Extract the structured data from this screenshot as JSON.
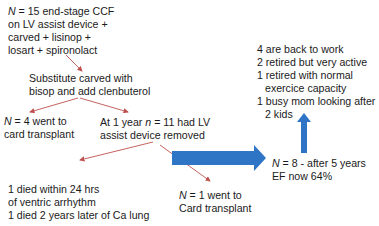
{
  "diagram": {
    "nodes": {
      "start": {
        "lines": [
          "N = 15 end-stage CCF",
          "on LV assist device +",
          "carved + lisinop +",
          "losart + spironolact"
        ]
      },
      "substitute": {
        "lines": [
          "Substitute carved with",
          "bisop and add clenbuterol"
        ]
      },
      "transplant_4": {
        "lines": [
          "N = 4 went to",
          "card transplant"
        ]
      },
      "removed_11": {
        "lines": [
          "At 1 year n = 11 had LV",
          "assist device removed"
        ]
      },
      "died": {
        "lines": [
          "1 died within 24 hrs",
          "of ventric arrhythm",
          "1 died 2 years later of Ca lung"
        ]
      },
      "transplant_1": {
        "lines": [
          "N = 1 went to",
          "Card transplant"
        ]
      },
      "outcome_8": {
        "lines": [
          "N = 8  - after 5 years",
          "EF now 64%"
        ]
      },
      "status": {
        "lines": [
          "4 are back to work",
          "2 retired but very active",
          "1 retired with normal",
          "exercice capacity",
          "1 busy mom looking after",
          "2 kids"
        ]
      }
    },
    "colors": {
      "thin_arrow": "#c0504d",
      "block_arrow": "#2e75c6",
      "text": "#1a1a1a",
      "background": "#ffffff"
    }
  }
}
